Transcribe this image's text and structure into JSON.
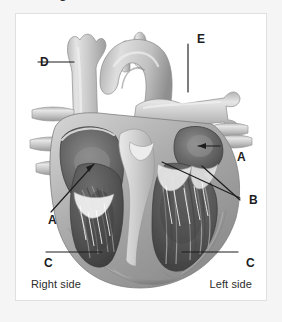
{
  "page": {
    "background_color": "#f5f5f5",
    "panel_background": "#ffffff",
    "panel_border_color": "#e0e0e0",
    "clipped_caption_fragment": "g"
  },
  "figure": {
    "rendering": "grayscale-anatomical-illustration",
    "orientation_labels": {
      "right": "Right side",
      "left": "Left side"
    },
    "label_cues": [
      {
        "id": "cue-d",
        "text": "D",
        "leader": "horizontal-right",
        "target": "superior-vena-cava"
      },
      {
        "id": "cue-e",
        "text": "E",
        "leader": "vertical-down",
        "target": "pulmonary-artery-branch"
      },
      {
        "id": "cue-a-right",
        "text": "A",
        "leader": "horizontal-left-arrow",
        "target": "left-atrium"
      },
      {
        "id": "cue-a-left",
        "text": "A",
        "leader": "diagonal-up-right",
        "target": "right-atrium"
      },
      {
        "id": "cue-b",
        "text": "B",
        "leader": "two-lines-left",
        "target": "atrioventricular-valves"
      },
      {
        "id": "cue-c-left",
        "text": "C",
        "leader": "horizontal-right",
        "target": "right-ventricle"
      },
      {
        "id": "cue-c-right",
        "text": "C",
        "leader": "horizontal-left",
        "target": "left-ventricle"
      }
    ],
    "colors": {
      "vessel_light": "#cfcfcf",
      "vessel_mid": "#a9a9a9",
      "chamber_dark": "#6e6e6e",
      "chamber_darkest": "#4a4a4a",
      "muscle_mid": "#9b9b9b",
      "muscle_light": "#c8c8c8",
      "septum_pale": "#e4e4e4",
      "leader_line": "#1d1d1d"
    }
  }
}
